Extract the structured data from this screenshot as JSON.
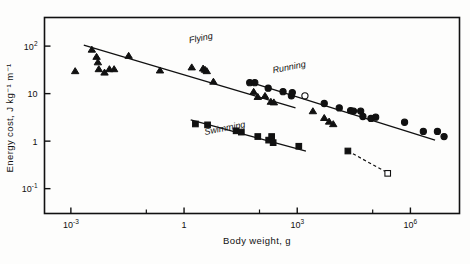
{
  "figure": {
    "name": "energy-cost-of-locomotion-plot",
    "background": "#fdfdfc",
    "ink_color": "#111111"
  },
  "chart_data": {
    "type": "scatter",
    "title": "",
    "xlabel": "Body weight, g",
    "ylabel": "Energy cost, J kg⁻¹ m⁻¹",
    "xscale": "log",
    "yscale": "log",
    "xlim": [
      0.0002,
      20000000
    ],
    "ylim": [
      0.03,
      400
    ],
    "grid": false,
    "legend": "inline-labels",
    "x_ticks": [
      {
        "value": 0.001,
        "label": "10",
        "exponent": "-3"
      },
      {
        "value": 1,
        "label": "1",
        "exponent": ""
      },
      {
        "value": 1000,
        "label": "10",
        "exponent": "3"
      },
      {
        "value": 1000000,
        "label": "10",
        "exponent": "6"
      }
    ],
    "x_minor_ticks": [
      0.1,
      100,
      100000
    ],
    "y_ticks": [
      {
        "value": 100,
        "label": "10",
        "exponent": "2"
      },
      {
        "value": 10,
        "label": "10",
        "exponent": ""
      },
      {
        "value": 1,
        "label": "1",
        "exponent": ""
      },
      {
        "value": 0.1,
        "label": "10",
        "exponent": "-1"
      }
    ],
    "series": [
      {
        "name": "Flying",
        "label": "Flying",
        "marker": "triangle",
        "filled": true,
        "color": "#111111",
        "label_x": 1.4,
        "label_y": 115,
        "fit_line": {
          "x1": 0.0022,
          "y1": 105,
          "x2": 900,
          "y2": 5.0
        },
        "points": [
          {
            "x": 0.0013,
            "y": 30
          },
          {
            "x": 0.0036,
            "y": 85
          },
          {
            "x": 0.0048,
            "y": 60
          },
          {
            "x": 0.0052,
            "y": 46
          },
          {
            "x": 0.0055,
            "y": 33
          },
          {
            "x": 0.0078,
            "y": 28
          },
          {
            "x": 0.0105,
            "y": 33
          },
          {
            "x": 0.014,
            "y": 33
          },
          {
            "x": 0.034,
            "y": 63
          },
          {
            "x": 0.23,
            "y": 31
          },
          {
            "x": 1.6,
            "y": 36
          },
          {
            "x": 3.2,
            "y": 34
          },
          {
            "x": 3.6,
            "y": 32
          },
          {
            "x": 4.0,
            "y": 30
          },
          {
            "x": 6.0,
            "y": 18
          },
          {
            "x": 70,
            "y": 11
          },
          {
            "x": 90,
            "y": 8.6
          },
          {
            "x": 140,
            "y": 9.0
          },
          {
            "x": 200,
            "y": 6.8
          },
          {
            "x": 240,
            "y": 6.6
          },
          {
            "x": 2600,
            "y": 4.3
          },
          {
            "x": 5200,
            "y": 3.1
          },
          {
            "x": 7000,
            "y": 2.6
          },
          {
            "x": 9000,
            "y": 2.3
          }
        ]
      },
      {
        "name": "Running",
        "label": "Running",
        "marker": "circle",
        "filled": true,
        "color": "#111111",
        "label_x": 230,
        "label_y": 27,
        "fit_line": {
          "x1": 48,
          "y1": 18,
          "x2": 4500000,
          "y2": 1.05
        },
        "points": [
          {
            "x": 55,
            "y": 17
          },
          {
            "x": 75,
            "y": 17
          },
          {
            "x": 170,
            "y": 13
          },
          {
            "x": 420,
            "y": 11
          },
          {
            "x": 700,
            "y": 9.0
          },
          {
            "x": 740,
            "y": 10.5
          },
          {
            "x": 5200,
            "y": 6.2
          },
          {
            "x": 13000,
            "y": 5.0
          },
          {
            "x": 26000,
            "y": 4.4
          },
          {
            "x": 31000,
            "y": 4.3
          },
          {
            "x": 48000,
            "y": 4.3
          },
          {
            "x": 55000,
            "y": 3.3
          },
          {
            "x": 90000,
            "y": 3.0
          },
          {
            "x": 120000,
            "y": 3.2
          },
          {
            "x": 700000,
            "y": 2.5
          },
          {
            "x": 2200000,
            "y": 1.6
          },
          {
            "x": 5200000,
            "y": 1.6
          },
          {
            "x": 7800000,
            "y": 1.25
          }
        ]
      },
      {
        "name": "Swimming",
        "label": "Swimming",
        "marker": "square",
        "filled": true,
        "color": "#111111",
        "label_x": 3.6,
        "label_y": 1.35,
        "fit_line": {
          "x1": 1.5,
          "y1": 2.8,
          "x2": 1700,
          "y2": 0.62
        },
        "points": [
          {
            "x": 2.0,
            "y": 2.3
          },
          {
            "x": 4.2,
            "y": 2.2
          },
          {
            "x": 24,
            "y": 1.65
          },
          {
            "x": 33,
            "y": 1.55
          },
          {
            "x": 90,
            "y": 1.25
          },
          {
            "x": 175,
            "y": 1.05
          },
          {
            "x": 210,
            "y": 1.25
          },
          {
            "x": 230,
            "y": 0.93
          },
          {
            "x": 1100,
            "y": 0.78
          },
          {
            "x": 22000,
            "y": 0.62
          }
        ]
      }
    ],
    "special_markers": [
      {
        "name": "open-circle-outlier",
        "marker": "circle",
        "filled": false,
        "x": 1600,
        "y": 9.0
      },
      {
        "name": "open-square-outlier",
        "marker": "square",
        "filled": false,
        "x": 250000,
        "y": 0.21
      }
    ],
    "dashed_lines": [
      {
        "name": "swimming-extrapolation",
        "x1": 22000,
        "y1": 0.62,
        "x2": 250000,
        "y2": 0.215
      }
    ]
  }
}
